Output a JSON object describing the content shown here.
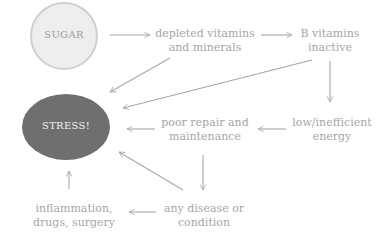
{
  "diagram": {
    "type": "flowchart",
    "colors": {
      "sugar_fill": "#eeeeee",
      "sugar_stroke": "#cfcfcf",
      "sugar_text": "#9a9a9a",
      "stress_fill": "#6f6f6f",
      "stress_text": "#f2f2f2",
      "text": "#a6a6a6",
      "arrow": "#a8a8a8"
    },
    "nodes": {
      "sugar": "SUGAR",
      "stress": "STRESS!",
      "depleted": "depleted vitamins\nand minerals",
      "b_vitamins": "B vitamins\ninactive",
      "low_energy": "low/inefficient\nenergy",
      "poor_repair": "poor repair and\nmaintenance",
      "disease": "any disease or\ncondition",
      "inflammation": "inflammation,\ndrugs, surgery"
    },
    "edges": [
      {
        "from": "sugar",
        "to": "depleted"
      },
      {
        "from": "depleted",
        "to": "b_vitamins"
      },
      {
        "from": "depleted",
        "to": "stress"
      },
      {
        "from": "b_vitamins",
        "to": "stress"
      },
      {
        "from": "b_vitamins",
        "to": "low_energy"
      },
      {
        "from": "low_energy",
        "to": "poor_repair"
      },
      {
        "from": "poor_repair",
        "to": "stress"
      },
      {
        "from": "poor_repair",
        "to": "disease"
      },
      {
        "from": "disease",
        "to": "stress"
      },
      {
        "from": "disease",
        "to": "inflammation"
      },
      {
        "from": "inflammation",
        "to": "stress"
      }
    ]
  }
}
